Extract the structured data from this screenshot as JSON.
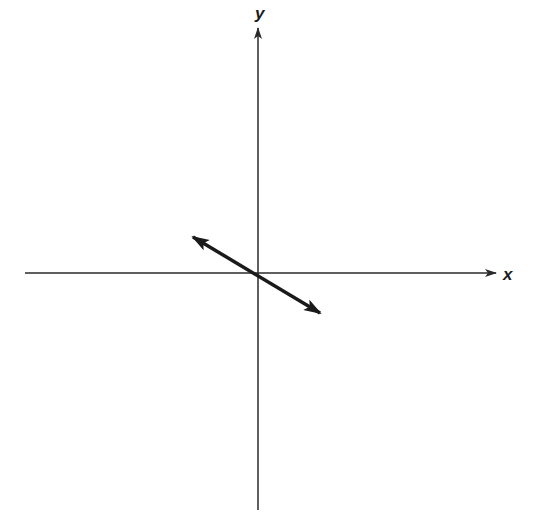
{
  "diagram": {
    "type": "coordinate-axes-with-double-arrow",
    "axes": {
      "x_label": "x",
      "y_label": "y",
      "origin_px": [
        258,
        273
      ]
    },
    "vector": {
      "description": "double-headed arrow through origin, oriented upper-left to lower-right",
      "tip_a_px": [
        193,
        237
      ],
      "tip_b_px": [
        320,
        313
      ]
    },
    "colors": {
      "axis": "#2a2a2a",
      "vector": "#1a1a1a",
      "background": "#ffffff"
    }
  }
}
